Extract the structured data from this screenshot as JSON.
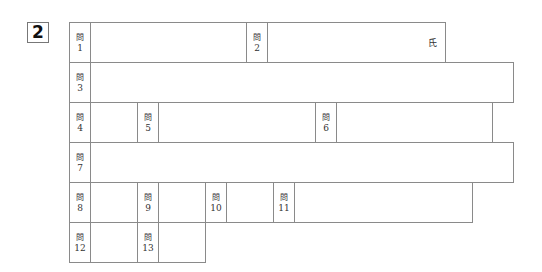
{
  "section_number": "2",
  "label_prefix": "問",
  "name_suffix": "氏",
  "rows": [
    {
      "top": 22,
      "cells": [
        {
          "type": "label",
          "num": "1",
          "left": 69,
          "width": 22
        },
        {
          "type": "answer",
          "left": 90,
          "width": 157
        },
        {
          "type": "label",
          "num": "2",
          "left": 246,
          "width": 22
        },
        {
          "type": "answer",
          "left": 267,
          "width": 179,
          "suffix": true
        }
      ]
    },
    {
      "top": 62,
      "cells": [
        {
          "type": "label",
          "num": "3",
          "left": 69,
          "width": 22
        },
        {
          "type": "answer",
          "left": 90,
          "width": 424
        }
      ]
    },
    {
      "top": 102,
      "cells": [
        {
          "type": "label",
          "num": "4",
          "left": 69,
          "width": 22
        },
        {
          "type": "answer",
          "left": 90,
          "width": 48
        },
        {
          "type": "label",
          "num": "5",
          "left": 137,
          "width": 22
        },
        {
          "type": "answer",
          "left": 158,
          "width": 158
        },
        {
          "type": "label",
          "num": "6",
          "left": 315,
          "width": 22
        },
        {
          "type": "answer",
          "left": 336,
          "width": 157
        }
      ]
    },
    {
      "top": 142,
      "cells": [
        {
          "type": "label",
          "num": "7",
          "left": 69,
          "width": 22
        },
        {
          "type": "answer",
          "left": 90,
          "width": 424
        }
      ]
    },
    {
      "top": 182,
      "cells": [
        {
          "type": "label",
          "num": "8",
          "left": 69,
          "width": 22
        },
        {
          "type": "answer",
          "left": 90,
          "width": 48
        },
        {
          "type": "label",
          "num": "9",
          "left": 137,
          "width": 22
        },
        {
          "type": "answer",
          "left": 158,
          "width": 48
        },
        {
          "type": "label",
          "num": "10",
          "left": 205,
          "width": 22
        },
        {
          "type": "answer",
          "left": 226,
          "width": 48
        },
        {
          "type": "label",
          "num": "11",
          "left": 273,
          "width": 22
        },
        {
          "type": "answer",
          "left": 294,
          "width": 179
        }
      ]
    },
    {
      "top": 222,
      "cells": [
        {
          "type": "label",
          "num": "12",
          "left": 69,
          "width": 22
        },
        {
          "type": "answer",
          "left": 90,
          "width": 48
        },
        {
          "type": "label",
          "num": "13",
          "left": 137,
          "width": 22
        },
        {
          "type": "answer",
          "left": 158,
          "width": 48
        }
      ]
    }
  ]
}
